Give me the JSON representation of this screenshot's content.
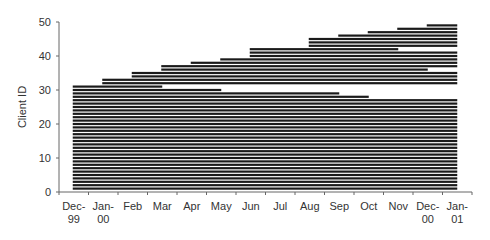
{
  "chart_data": {
    "type": "bar",
    "subtype": "horizontal-timeline (gantt-style client activity)",
    "title": "",
    "xlabel": "",
    "ylabel": "Client ID",
    "ylim": [
      0,
      50
    ],
    "yticks": [
      0,
      10,
      20,
      30,
      40,
      50
    ],
    "categories": [
      "Dec-99",
      "Jan-00",
      "Feb",
      "Mar",
      "Apr",
      "May",
      "Jun",
      "Jul",
      "Aug",
      "Sep",
      "Oct",
      "Nov",
      "Dec-00",
      "Jan-01"
    ],
    "x_labels": [
      {
        "line1": "Dec-",
        "line2": "99"
      },
      {
        "line1": "Jan-",
        "line2": "00"
      },
      {
        "line1": "Feb",
        "line2": ""
      },
      {
        "line1": "Mar",
        "line2": ""
      },
      {
        "line1": "Apr",
        "line2": ""
      },
      {
        "line1": "May",
        "line2": ""
      },
      {
        "line1": "Jun",
        "line2": ""
      },
      {
        "line1": "Jul",
        "line2": ""
      },
      {
        "line1": "Aug",
        "line2": ""
      },
      {
        "line1": "Sep",
        "line2": ""
      },
      {
        "line1": "Oct",
        "line2": ""
      },
      {
        "line1": "Nov",
        "line2": ""
      },
      {
        "line1": "Dec-",
        "line2": "00"
      },
      {
        "line1": "Jan-",
        "line2": "01"
      }
    ],
    "grid": false,
    "legend": null,
    "bar_color": "#1a1a1a",
    "series": [
      {
        "name": "client activity span (start month index → end month index)",
        "clients": [
          {
            "id": 1,
            "start": 0,
            "end": 13
          },
          {
            "id": 2,
            "start": 0,
            "end": 13
          },
          {
            "id": 3,
            "start": 0,
            "end": 13
          },
          {
            "id": 4,
            "start": 0,
            "end": 13
          },
          {
            "id": 5,
            "start": 0,
            "end": 13
          },
          {
            "id": 6,
            "start": 0,
            "end": 13
          },
          {
            "id": 7,
            "start": 0,
            "end": 13
          },
          {
            "id": 8,
            "start": 0,
            "end": 13
          },
          {
            "id": 9,
            "start": 0,
            "end": 13
          },
          {
            "id": 10,
            "start": 0,
            "end": 13
          },
          {
            "id": 11,
            "start": 0,
            "end": 13
          },
          {
            "id": 12,
            "start": 0,
            "end": 13
          },
          {
            "id": 13,
            "start": 0,
            "end": 13
          },
          {
            "id": 14,
            "start": 0,
            "end": 13
          },
          {
            "id": 15,
            "start": 0,
            "end": 13
          },
          {
            "id": 16,
            "start": 0,
            "end": 13
          },
          {
            "id": 17,
            "start": 0,
            "end": 13
          },
          {
            "id": 18,
            "start": 0,
            "end": 13
          },
          {
            "id": 19,
            "start": 0,
            "end": 13
          },
          {
            "id": 20,
            "start": 0,
            "end": 13
          },
          {
            "id": 21,
            "start": 0,
            "end": 13
          },
          {
            "id": 22,
            "start": 0,
            "end": 13
          },
          {
            "id": 23,
            "start": 0,
            "end": 13
          },
          {
            "id": 24,
            "start": 0,
            "end": 13
          },
          {
            "id": 25,
            "start": 0,
            "end": 13
          },
          {
            "id": 26,
            "start": 0,
            "end": 13
          },
          {
            "id": 27,
            "start": 0,
            "end": 13
          },
          {
            "id": 28,
            "start": 0,
            "end": 10
          },
          {
            "id": 29,
            "start": 0,
            "end": 9
          },
          {
            "id": 30,
            "start": 0,
            "end": 5
          },
          {
            "id": 31,
            "start": 0,
            "end": 3
          },
          {
            "id": 32,
            "start": 1,
            "end": 13
          },
          {
            "id": 33,
            "start": 1,
            "end": 13
          },
          {
            "id": 34,
            "start": 2,
            "end": 13
          },
          {
            "id": 35,
            "start": 2,
            "end": 13
          },
          {
            "id": 36,
            "start": 3,
            "end": 12
          },
          {
            "id": 37,
            "start": 3,
            "end": 13
          },
          {
            "id": 38,
            "start": 4,
            "end": 13
          },
          {
            "id": 39,
            "start": 5,
            "end": 13
          },
          {
            "id": 40,
            "start": 6,
            "end": 13
          },
          {
            "id": 41,
            "start": 6,
            "end": 13
          },
          {
            "id": 42,
            "start": 6,
            "end": 11
          },
          {
            "id": 43,
            "start": 8,
            "end": 13
          },
          {
            "id": 44,
            "start": 8,
            "end": 13
          },
          {
            "id": 45,
            "start": 8,
            "end": 13
          },
          {
            "id": 46,
            "start": 9,
            "end": 13
          },
          {
            "id": 47,
            "start": 10,
            "end": 13
          },
          {
            "id": 48,
            "start": 11,
            "end": 13
          },
          {
            "id": 49,
            "start": 12,
            "end": 13
          }
        ]
      }
    ]
  }
}
